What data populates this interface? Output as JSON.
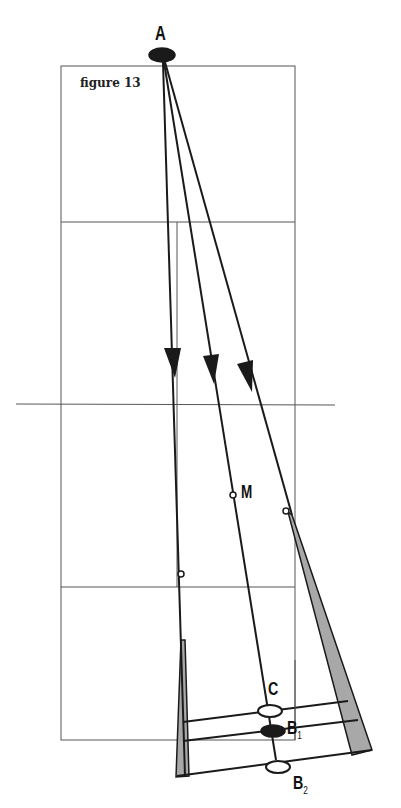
{
  "figure": {
    "caption": "figure 13",
    "labels": {
      "A": "A",
      "M": "M",
      "C": "C",
      "B1_main": "B",
      "B1_sub": "1",
      "B2_main": "B",
      "B2_sub": "2"
    },
    "colors": {
      "line": "#1a1a1a",
      "grid": "#555555",
      "shade": "#a8a8a8",
      "background": "#ffffff"
    }
  }
}
